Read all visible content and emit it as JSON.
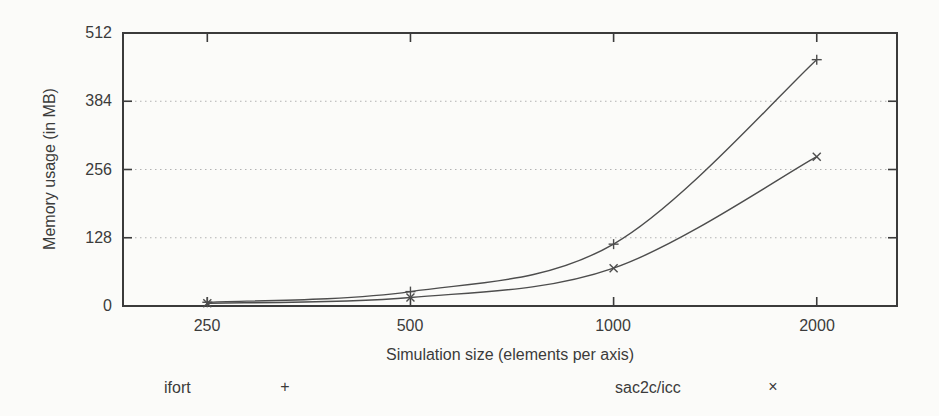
{
  "figure": {
    "background": "#fbfbf9",
    "ink": "#3b3b3b",
    "curve_color": "#4d4d4d",
    "grid_color": "#b3b3b3"
  },
  "chart_data": {
    "type": "line",
    "title": "",
    "xlabel": "Simulation size (elements per axis)",
    "ylabel": "Memory usage (in MB)",
    "x_scale": "log2",
    "x": [
      250,
      500,
      1000,
      2000
    ],
    "xtick_labels": [
      "250",
      "500",
      "1000",
      "2000"
    ],
    "yticks": [
      0,
      128,
      256,
      384,
      512
    ],
    "ytick_labels": [
      "0",
      "128",
      "256",
      "384",
      "512"
    ],
    "ylim": [
      0,
      512
    ],
    "grid": "horizontal-dotted",
    "legend_position": "bottom",
    "series": [
      {
        "name": "ifort",
        "marker": "+",
        "values": [
          7,
          27,
          116,
          462
        ]
      },
      {
        "name": "sac2c/icc",
        "marker": "×",
        "values": [
          5,
          16,
          71,
          280
        ]
      }
    ]
  },
  "legend": {
    "entries": [
      {
        "label": "ifort",
        "marker": "+"
      },
      {
        "label": "sac2c/icc",
        "marker": "×"
      }
    ]
  }
}
